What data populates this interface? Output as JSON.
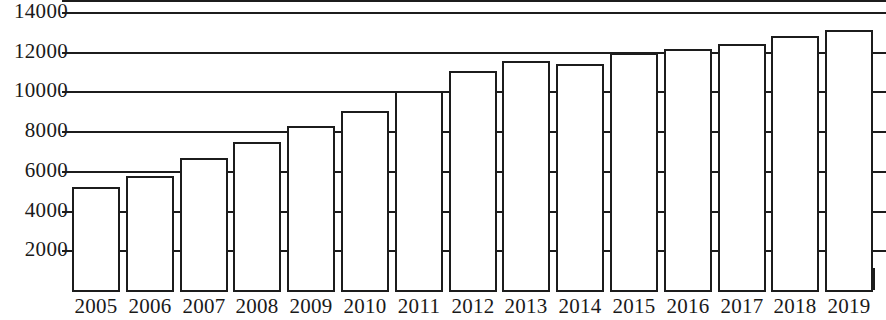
{
  "chart_data": {
    "type": "bar",
    "title": "",
    "subtitle": "",
    "xlabel": "",
    "ylabel": "",
    "categories": [
      "2005",
      "2006",
      "2007",
      "2008",
      "2009",
      "2010",
      "2011",
      "2012",
      "2013",
      "2014",
      "2015",
      "2016",
      "2017",
      "2018",
      "2019"
    ],
    "values": [
      5200,
      5750,
      6650,
      7450,
      8250,
      9000,
      10000,
      11050,
      11550,
      11400,
      11950,
      12150,
      12400,
      12800,
      13100
    ],
    "series": [
      {
        "name": "",
        "values": [
          5200,
          5750,
          6650,
          7450,
          8250,
          9000,
          10000,
          11050,
          11550,
          11400,
          11950,
          12150,
          12400,
          12800,
          13100
        ]
      }
    ],
    "ylim": [
      0,
      14000
    ],
    "ytick_values": [
      2000,
      4000,
      6000,
      8000,
      10000,
      12000,
      14000
    ],
    "ytick_labels": [
      "2000",
      "4000",
      "6000",
      "8000",
      "10000",
      "12000",
      "14000"
    ],
    "grid": true,
    "grid_axis": "y",
    "legend": null,
    "legend_position": "none",
    "annotations": [],
    "colors": {
      "bar_fill": "#ffffff",
      "bar_stroke": "#1c1c1c",
      "gridline": "#1c1c1c",
      "axis": "#1c1c1c",
      "text": "#1a1a1a",
      "background": "#ffffff"
    },
    "bar_style": "outlined-white"
  }
}
